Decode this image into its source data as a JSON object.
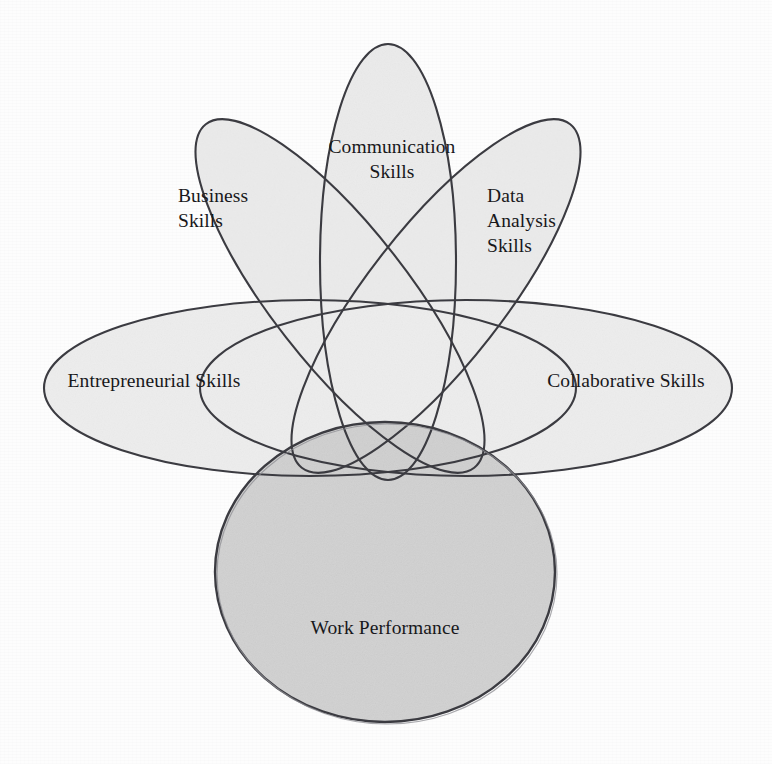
{
  "diagram": {
    "type": "venn",
    "title": "",
    "background_color": "#fdfdfd",
    "stroke_color": "#3b3b41",
    "petal_fill_color": "#ededed",
    "ellipse_fill_color": "#eeeeee",
    "outcome_fill_color": "#cfcfcf",
    "sets": [
      {
        "key": "business",
        "label": "Business\nSkills",
        "shape": "petal-ellipse",
        "role": "skill",
        "position": "upper-left",
        "rotation_deg": -38
      },
      {
        "key": "communication",
        "label": "Communication\nSkills",
        "shape": "petal-ellipse",
        "role": "skill",
        "position": "top-center",
        "rotation_deg": 0
      },
      {
        "key": "data_analysis",
        "label": "Data\nAnalysis\nSkills",
        "shape": "petal-ellipse",
        "role": "skill",
        "position": "upper-right",
        "rotation_deg": 38
      },
      {
        "key": "entrepreneurial",
        "label": "Entrepreneurial Skills",
        "shape": "horizontal-ellipse",
        "role": "skill",
        "position": "left",
        "rotation_deg": 0
      },
      {
        "key": "collaborative",
        "label": "Collaborative Skills",
        "shape": "horizontal-ellipse",
        "role": "skill",
        "position": "right",
        "rotation_deg": 0
      },
      {
        "key": "work_performance",
        "label": "Work Performance",
        "shape": "circle",
        "role": "outcome",
        "position": "bottom-center",
        "rotation_deg": 0
      }
    ]
  }
}
